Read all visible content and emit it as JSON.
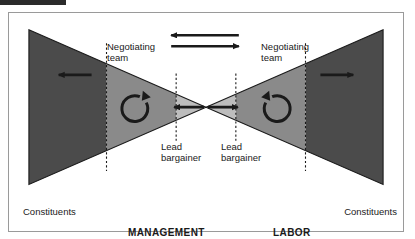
{
  "figure": {
    "title_alt": "Bowtie negotiation structure diagram",
    "labels": {
      "negotiating_team_left": "Negotiating\nteam",
      "negotiating_team_right": "Negotiating\nteam",
      "lead_bargainer_left": "Lead\nbargainer",
      "lead_bargainer_right": "Lead\nbargainer",
      "constituents_left": "Constituents",
      "constituents_right": "Constituents",
      "side_left": "MANAGEMENT",
      "side_right": "LABOR"
    },
    "icons": {
      "arrow_left_top": "arrow-left",
      "arrow_right_bottom": "arrow-right",
      "arrow_outward_left": "arrow-left",
      "arrow_outward_right": "arrow-right",
      "arrow_inward_left": "arrow-right-to-line",
      "arrow_inward_right": "arrow-left-to-line",
      "circular_arrow_left": "circular-arrow-counterclockwise",
      "circular_arrow_right": "circular-arrow-clockwise"
    },
    "colors": {
      "band_dark": "#4b4b4b",
      "band_mid": "#8a8a8a",
      "band_light": "#bdbdbd",
      "outline": "#1a1a1a",
      "frame_border": "#9a9a9a",
      "background": "#ffffff",
      "text": "#1a1a1a"
    },
    "geometry": {
      "left_triangle": "apex at center, base at left edge",
      "right_triangle": "apex at center, base at right edge",
      "band_divider_style": "dashed vertical line",
      "crossing_point_x_pct": 50
    }
  }
}
